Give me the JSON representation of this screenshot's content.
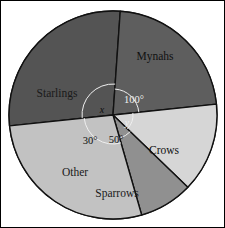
{
  "chart_data": {
    "type": "pie",
    "title": "",
    "center": {
      "x": 112,
      "y": 114
    },
    "radius": 104,
    "legend_position": "none",
    "grid": false,
    "categories": [
      "Mynahs",
      "Crows",
      "Sparrows",
      "Other",
      "Starlings"
    ],
    "values": [
      100,
      80,
      50,
      30,
      100
    ],
    "angle_labels": [
      "100°",
      "y",
      "50°",
      "30°",
      "x"
    ],
    "slices": [
      {
        "label": "Mynahs",
        "angle_text": "100°",
        "angle_value": 100,
        "color": "#545454",
        "start_deg": -96,
        "end_deg": 4,
        "label_x": 154,
        "label_y": 56,
        "on_dark": true
      },
      {
        "label": "Crows",
        "angle_text": "y",
        "angle_value": 80,
        "color": "#5e5e5e",
        "start_deg": 4,
        "end_deg": 84,
        "label_x": 163,
        "label_y": 150,
        "on_dark": true
      },
      {
        "label": "Sparrows",
        "angle_text": "50°",
        "angle_value": 50,
        "color": "#d6d6d6",
        "start_deg": 84,
        "end_deg": 134,
        "label_x": 116,
        "label_y": 193,
        "on_dark": false
      },
      {
        "label": "Other",
        "angle_text": "30°",
        "angle_value": 30,
        "color": "#909090",
        "start_deg": 134,
        "end_deg": 164,
        "label_x": 74,
        "label_y": 172,
        "on_dark": false
      },
      {
        "label": "Starlings",
        "angle_text": "x",
        "angle_value": 100,
        "color": "#c2c2c2",
        "start_deg": 164,
        "end_deg": 264,
        "label_x": 56,
        "label_y": 93,
        "on_dark": false
      }
    ],
    "annotations": [
      {
        "name": "angle-100",
        "text": "100°",
        "x": 133,
        "y": 100,
        "on_dark": true,
        "italic": false
      },
      {
        "name": "angle-x",
        "text": "x",
        "x": 101,
        "y": 110,
        "on_dark": false,
        "italic": true
      },
      {
        "name": "angle-y",
        "text": "y",
        "x": 126,
        "y": 123,
        "on_dark": true,
        "italic": true
      },
      {
        "name": "angle-30",
        "text": "30°",
        "x": 89,
        "y": 141,
        "on_dark": false,
        "italic": false
      },
      {
        "name": "angle-50",
        "text": "50°",
        "x": 115,
        "y": 140,
        "on_dark": false,
        "italic": false
      }
    ]
  },
  "figure": {
    "background_color": "#ffffff",
    "border_color": "#000000",
    "slice_edge_color": "#111111",
    "arc_marker_color": "#efefef"
  }
}
